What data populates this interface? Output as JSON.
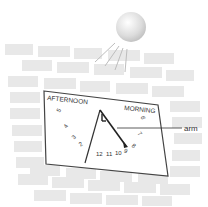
{
  "diagram": {
    "sun": {
      "icon": "sun-icon",
      "rays": 4
    },
    "dial": {
      "left_label": "AFTERNOON",
      "right_label": "MORNING",
      "hours_afternoon": [
        "5",
        "4",
        "3",
        "2"
      ],
      "hours_bottom": [
        "12",
        "11",
        "10",
        "9",
        "8"
      ],
      "hours_morning": [
        "7",
        "6"
      ]
    },
    "callout": {
      "label": "arm"
    },
    "colors": {
      "brick": "#e6e6e6",
      "dial_face": "#ffffff",
      "dial_border": "#444444",
      "arm": "#222222",
      "sun": "#d8d8d8"
    }
  }
}
